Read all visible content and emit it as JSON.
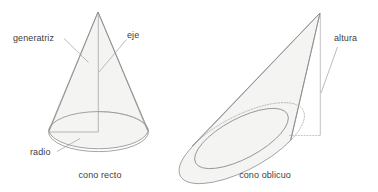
{
  "figure": {
    "background_color": "#ffffff",
    "line_color": "#8b8b8b",
    "fill_color": "#f4f4f2",
    "text_color": "#3d3d3d"
  },
  "right_cone": {
    "caption": "cono recto",
    "labels": {
      "generatriz": "generatriz",
      "eje": "eje",
      "radio": "radio"
    }
  },
  "oblique_cone": {
    "caption": "cono oblicuo",
    "labels": {
      "altura": "altura"
    }
  }
}
